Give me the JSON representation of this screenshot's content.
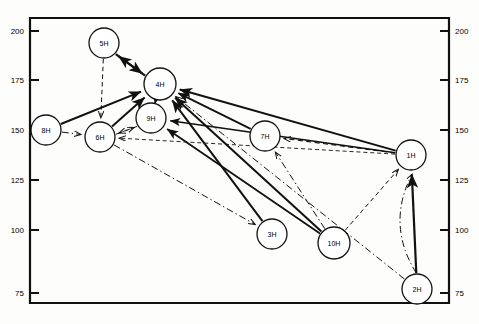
{
  "figure": {
    "type": "network-diagram",
    "background": "#fdfdfc",
    "line_color": "#111111",
    "node_fill": "#ffffff",
    "node_stroke": "#111111"
  },
  "axes": {
    "left": {
      "ticks": [
        "200",
        "175",
        "150",
        "125",
        "100",
        "75"
      ],
      "tick_y": [
        31,
        80,
        130,
        180,
        230,
        293
      ],
      "x": 30
    },
    "right": {
      "ticks": [
        "200",
        "175",
        "150",
        "125",
        "100",
        "75"
      ],
      "tick_y": [
        31,
        80,
        130,
        180,
        230,
        293
      ],
      "x": 449
    },
    "frame": {
      "x": 30,
      "y": 18,
      "width": 419,
      "height": 285
    }
  },
  "nodes": [
    {
      "id": "5H",
      "label": "5H",
      "cx": 104,
      "cy": 43,
      "r": 15
    },
    {
      "id": "4H",
      "label": "4H",
      "cx": 160,
      "cy": 84,
      "r": 16
    },
    {
      "id": "9H",
      "label": "9H",
      "cx": 151,
      "cy": 118,
      "r": 15
    },
    {
      "id": "8H",
      "label": "8H",
      "cx": 46,
      "cy": 130,
      "r": 15
    },
    {
      "id": "6H",
      "label": "6H",
      "cx": 100,
      "cy": 137,
      "r": 15
    },
    {
      "id": "7H",
      "label": "7H",
      "cx": 265,
      "cy": 136,
      "r": 15
    },
    {
      "id": "1H",
      "label": "1H",
      "cx": 411,
      "cy": 155,
      "r": 15
    },
    {
      "id": "3H",
      "label": "3H",
      "cx": 272,
      "cy": 234,
      "r": 15
    },
    {
      "id": "10H",
      "label": "10H",
      "cx": 334,
      "cy": 243,
      "r": 16
    },
    {
      "id": "2H",
      "label": "2H",
      "cx": 417,
      "cy": 289,
      "r": 15
    }
  ],
  "edges": [
    {
      "from": "5H",
      "to": "4H",
      "style": "solid",
      "arrow": "to",
      "width": 2.1,
      "offset": 2
    },
    {
      "from": "4H",
      "to": "5H",
      "style": "solid",
      "arrow": "to",
      "width": 2.1,
      "offset": -2
    },
    {
      "from": "5H",
      "to": "6H",
      "style": "dashed",
      "arrow": "to",
      "width": 1.0,
      "offset": 0
    },
    {
      "from": "8H",
      "to": "4H",
      "style": "solid",
      "arrow": "to",
      "width": 2.0,
      "offset": 0
    },
    {
      "from": "8H",
      "to": "6H",
      "style": "dashdot",
      "arrow": "to",
      "width": 1.0,
      "offset": 0
    },
    {
      "from": "6H",
      "to": "4H",
      "style": "solid",
      "arrow": "to",
      "width": 2.0,
      "offset": 0
    },
    {
      "from": "6H",
      "to": "9H",
      "style": "dashed",
      "arrow": "to",
      "width": 1.0,
      "offset": 3
    },
    {
      "from": "9H",
      "to": "6H",
      "style": "dashed",
      "arrow": "to",
      "width": 1.0,
      "offset": -3
    },
    {
      "from": "9H",
      "to": "4H",
      "style": "solid",
      "arrow": "to",
      "width": 1.8,
      "offset": 0
    },
    {
      "from": "6H",
      "to": "3H",
      "style": "dashdot",
      "arrow": "to",
      "width": 1.0,
      "offset": 0
    },
    {
      "from": "3H",
      "to": "4H",
      "style": "solid",
      "arrow": "to",
      "width": 2.0,
      "offset": 0
    },
    {
      "from": "10H",
      "to": "4H",
      "style": "solid",
      "arrow": "to",
      "width": 2.0,
      "offset": 0
    },
    {
      "from": "10H",
      "to": "9H",
      "style": "solid",
      "arrow": "to",
      "width": 1.8,
      "offset": 0
    },
    {
      "from": "10H",
      "to": "7H",
      "style": "dashdot",
      "arrow": "to",
      "width": 1.0,
      "offset": 0
    },
    {
      "from": "10H",
      "to": "1H",
      "style": "dashed",
      "arrow": "to",
      "width": 1.0,
      "offset": 0
    },
    {
      "from": "7H",
      "to": "4H",
      "style": "solid",
      "arrow": "to",
      "width": 1.8,
      "offset": 0
    },
    {
      "from": "1H",
      "to": "4H",
      "style": "solid",
      "arrow": "to",
      "width": 2.0,
      "offset": 0
    },
    {
      "from": "1H",
      "to": "9H",
      "style": "solid",
      "arrow": "to",
      "width": 1.6,
      "offset": 0
    },
    {
      "from": "1H",
      "to": "7H",
      "style": "dashed",
      "arrow": "to",
      "width": 1.1,
      "offset": 0
    },
    {
      "from": "1H",
      "to": "6H",
      "style": "dashed",
      "arrow": "to",
      "width": 0.9,
      "offset": 0
    },
    {
      "from": "2H",
      "to": "1H",
      "style": "solid",
      "arrow": "to",
      "width": 2.2,
      "offset": 0
    },
    {
      "from": "2H",
      "to": "1H",
      "style": "dashdot",
      "arrow": "to",
      "width": 1.0,
      "offset": 0,
      "bow": -28
    },
    {
      "from": "2H",
      "to": "4H",
      "style": "dashdot",
      "arrow": "to",
      "width": 1.0,
      "offset": 0
    }
  ]
}
